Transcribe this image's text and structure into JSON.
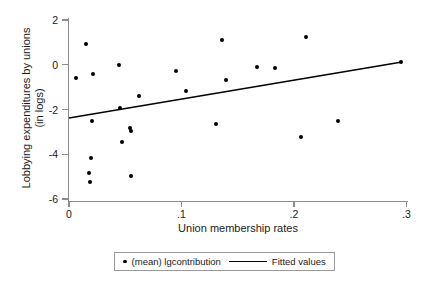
{
  "chart_data": {
    "type": "scatter",
    "title": "",
    "xlabel": "Union membership rates",
    "ylabel_line1": "Lobbying expenditures by unions",
    "ylabel_line2": "(in logs)",
    "xlim": [
      0,
      0.31
    ],
    "ylim": [
      -6.6,
      2.3
    ],
    "xticks": [
      0,
      0.1,
      0.2,
      0.3
    ],
    "xtick_labels": [
      "0",
      ".1",
      ".2",
      ".3"
    ],
    "yticks": [
      2,
      0,
      -2,
      -4,
      -6
    ],
    "ytick_labels": [
      "2",
      "0",
      "-2",
      "-4",
      "-6"
    ],
    "grid": false,
    "legend_position": "bottom-center",
    "series": [
      {
        "name": "(mean) lgcontribution",
        "type": "scatter",
        "marker": "filled-circle",
        "color": "#000000",
        "points": [
          {
            "x": 0.0151,
            "y": 3.07,
            "px": 86,
            "py": 44
          },
          {
            "x": 0.0062,
            "y": 0.48,
            "px": 76,
            "py": 78
          },
          {
            "x": 0.0213,
            "y": 0.66,
            "px": 93,
            "py": 74
          },
          {
            "x": 0.0444,
            "y": 1.06,
            "px": 119,
            "py": 65
          },
          {
            "x": 0.0622,
            "y": -1.33,
            "px": 139,
            "py": 96
          },
          {
            "x": 0.0453,
            "y": -1.87,
            "px": 120,
            "py": 108
          },
          {
            "x": 0.0951,
            "y": 0.79,
            "px": 176,
            "py": 71
          },
          {
            "x": 0.0204,
            "y": -2.51,
            "px": 92,
            "py": 121
          },
          {
            "x": 0.0542,
            "y": -2.82,
            "px": 130,
            "py": 128
          },
          {
            "x": 0.0551,
            "y": -2.96,
            "px": 131,
            "py": 131
          },
          {
            "x": 0.0471,
            "y": -3.45,
            "px": 122,
            "py": 142
          },
          {
            "x": 0.0196,
            "y": -4.17,
            "px": 91,
            "py": 158
          },
          {
            "x": 0.0178,
            "y": -4.84,
            "px": 89,
            "py": 173
          },
          {
            "x": 0.0187,
            "y": -5.24,
            "px": 90,
            "py": 182
          },
          {
            "x": 0.0551,
            "y": -4.97,
            "px": 131,
            "py": 176
          },
          {
            "x": 0.136,
            "y": 1.11,
            "px": 222,
            "py": 40
          },
          {
            "x": 0.211,
            "y": 1.24,
            "px": 306,
            "py": 37
          },
          {
            "x": 0.167,
            "y": -0.1,
            "px": 257,
            "py": 67
          },
          {
            "x": 0.183,
            "y": -0.15,
            "px": 275,
            "py": 68
          },
          {
            "x": 0.14,
            "y": -0.68,
            "px": 226,
            "py": 80
          },
          {
            "x": 0.104,
            "y": -1.17,
            "px": 186,
            "py": 91
          },
          {
            "x": 0.295,
            "y": 0.12,
            "px": 401,
            "py": 62
          },
          {
            "x": 0.131,
            "y": -2.65,
            "px": 216,
            "py": 124
          },
          {
            "x": 0.239,
            "y": -2.52,
            "px": 338,
            "py": 121
          },
          {
            "x": 0.206,
            "y": -3.23,
            "px": 301,
            "py": 137
          }
        ]
      },
      {
        "name": "Fitted values",
        "type": "line",
        "color": "#000000",
        "x_start": 0.0,
        "y_start": -2.38,
        "x_end": 0.295,
        "y_end": 0.12,
        "px_start": 69,
        "py_start": 118,
        "px_end": 402,
        "py_end": 62
      }
    ]
  },
  "legend": {
    "scatter_label": "(mean) lgcontribution",
    "line_label": "Fitted values"
  }
}
